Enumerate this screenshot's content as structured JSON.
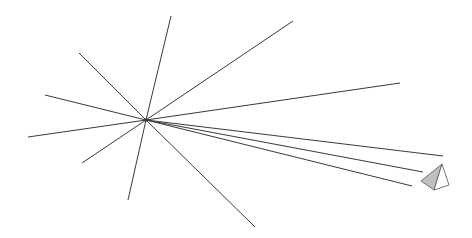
{
  "diagram": {
    "colors": {
      "background": "#ffffff",
      "line": "#3a3a3a",
      "pyramid_shaded_face": "#c0c0c0",
      "pyramid_light_face": "#ffffff",
      "pyramid_edge": "#555555"
    },
    "center": [
      146,
      120
    ],
    "rays": [
      {
        "to": [
          171,
          16
        ]
      },
      {
        "to": [
          128,
          200
        ]
      },
      {
        "to": [
          293,
          21
        ]
      },
      {
        "to": [
          79,
          53
        ]
      },
      {
        "to": [
          45,
          95
        ]
      },
      {
        "to": [
          28,
          137
        ]
      },
      {
        "to": [
          82,
          163
        ]
      },
      {
        "to": [
          255,
          227
        ]
      },
      {
        "to": [
          400,
          83
        ]
      },
      {
        "to": [
          443,
          156
        ]
      },
      {
        "to": [
          423,
          172
        ]
      },
      {
        "to": [
          412,
          186
        ]
      }
    ],
    "pyramid": {
      "apex": [
        442,
        164
      ],
      "left": [
        421,
        181
      ],
      "bottom": [
        434,
        190
      ],
      "right": [
        449,
        185
      ]
    }
  }
}
